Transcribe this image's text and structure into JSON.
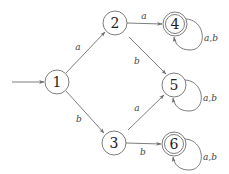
{
  "diagram": {
    "type": "DFA",
    "start_state": "1",
    "states": [
      {
        "id": "1",
        "label": "1",
        "x": 57,
        "y": 82,
        "accepting": false
      },
      {
        "id": "2",
        "label": "2",
        "x": 115,
        "y": 23,
        "accepting": false
      },
      {
        "id": "3",
        "label": "3",
        "x": 114,
        "y": 143,
        "accepting": false
      },
      {
        "id": "4",
        "label": "4",
        "x": 175,
        "y": 24,
        "accepting": true
      },
      {
        "id": "5",
        "label": "5",
        "x": 174,
        "y": 85,
        "accepting": false
      },
      {
        "id": "6",
        "label": "6",
        "x": 174,
        "y": 144,
        "accepting": true
      }
    ],
    "transitions": [
      {
        "from": "1",
        "to": "2",
        "label": "a"
      },
      {
        "from": "1",
        "to": "3",
        "label": "b"
      },
      {
        "from": "2",
        "to": "4",
        "label": "a"
      },
      {
        "from": "2",
        "to": "5",
        "label": "b"
      },
      {
        "from": "3",
        "to": "5",
        "label": "a"
      },
      {
        "from": "3",
        "to": "6",
        "label": "b"
      },
      {
        "from": "4",
        "to": "4",
        "label": "a,b"
      },
      {
        "from": "5",
        "to": "5",
        "label": "a,b"
      },
      {
        "from": "6",
        "to": "6",
        "label": "a,b"
      }
    ],
    "colors": {
      "stroke": "#6e6e6e",
      "text": "#222222",
      "background": "#ffffff"
    }
  }
}
